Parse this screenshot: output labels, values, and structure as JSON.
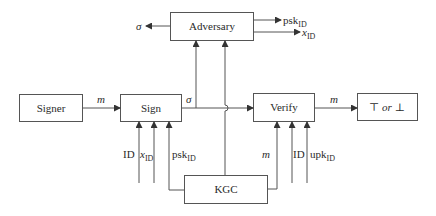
{
  "diagram": {
    "boxes": {
      "adversary": "Adversary",
      "signer": "Signer",
      "sign": "Sign",
      "verify": "Verify",
      "result_top": "⊤",
      "result_or": "or",
      "result_bottom": "⊥",
      "kgc": "KGC"
    },
    "edges": {
      "adversary_out_sigma": "σ",
      "adversary_out_psk": "psk",
      "adversary_out_psk_sub": "ID",
      "adversary_out_x": "x",
      "adversary_out_x_sub": "ID",
      "signer_to_sign_m": "m",
      "sign_out_sigma": "σ",
      "verify_to_result_m": "m",
      "sign_in_id": "ID",
      "sign_in_x": "x",
      "sign_in_x_sub": "ID",
      "sign_in_psk": "psk",
      "sign_in_psk_sub": "ID",
      "verify_in_m": "m",
      "verify_in_id": "ID",
      "verify_in_upk": "upk",
      "verify_in_upk_sub": "ID"
    }
  }
}
